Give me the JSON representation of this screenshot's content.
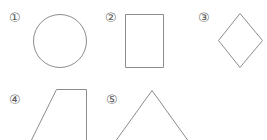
{
  "page": {
    "background_color": "#ffffff",
    "stroke_color": "#8c8c8c",
    "marker_color": "#5a5a5a",
    "width": 267,
    "height": 140
  },
  "figures": [
    {
      "marker": "①",
      "number": "1",
      "shape": "circle",
      "shape_label": "circle",
      "marker_x": 9,
      "marker_y": 11,
      "geometry": {
        "cx": 59,
        "cy": 40.5,
        "r": 26.5
      },
      "cropped": false
    },
    {
      "marker": "②",
      "number": "2",
      "shape": "rectangle",
      "shape_label": "rectangle",
      "marker_x": 105,
      "marker_y": 11,
      "geometry": {
        "x": 126,
        "y": 15,
        "width": 38,
        "height": 53
      },
      "cropped": false
    },
    {
      "marker": "③",
      "number": "3",
      "shape": "diamond",
      "shape_label": "rhombus (square rotated 45 degrees)",
      "marker_x": 198,
      "marker_y": 11,
      "geometry": {
        "points": "240.5,14 262,40.5 240.5,67 219,40.5"
      },
      "cropped": false
    },
    {
      "marker": "④",
      "number": "4",
      "shape": "trapezoid",
      "shape_label": "right trapezoid",
      "marker_x": 9,
      "marker_y": 93,
      "geometry": {
        "points": "57,90 87,90 87,141 28,141"
      },
      "cropped": true
    },
    {
      "marker": "⑤",
      "number": "5",
      "shape": "triangle",
      "shape_label": "isosceles triangle",
      "marker_x": 106,
      "marker_y": 93,
      "geometry": {
        "points": "152,91 188,141 116,141"
      },
      "cropped": true
    }
  ]
}
